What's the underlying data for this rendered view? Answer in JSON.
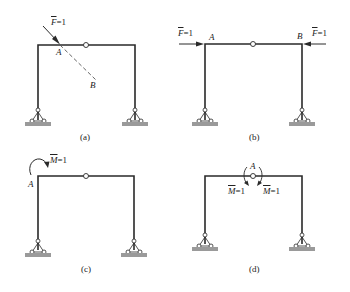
{
  "colors": {
    "member": "#2a2a2a",
    "dashed": "#555555",
    "ground": "#9a9a9a"
  },
  "panels": [
    {
      "id": "a",
      "caption": "(a)",
      "labels": {
        "force": "F",
        "force_value": "=1",
        "point_a": "A",
        "point_b": "B"
      },
      "description": "Three-hinged frame with unit force F=1 applied at joint A along line AB (dashed)"
    },
    {
      "id": "b",
      "caption": "(b)",
      "labels": {
        "force_left": "F",
        "force_left_value": "=1",
        "force_right": "F",
        "force_right_value": "=1",
        "point_a": "A",
        "point_b": "B"
      },
      "description": "Pair of equal and opposite unit horizontal forces at A and B"
    },
    {
      "id": "c",
      "caption": "(c)",
      "labels": {
        "moment": "M",
        "moment_value": "=1",
        "point_a": "A"
      },
      "description": "Unit moment M=1 applied at joint A"
    },
    {
      "id": "d",
      "caption": "(d)",
      "labels": {
        "point_a": "A",
        "moment_left": "M",
        "moment_left_value": "=1",
        "moment_right": "M",
        "moment_right_value": "=1"
      },
      "description": "Pair of equal and opposite unit moments at hinge A"
    }
  ]
}
